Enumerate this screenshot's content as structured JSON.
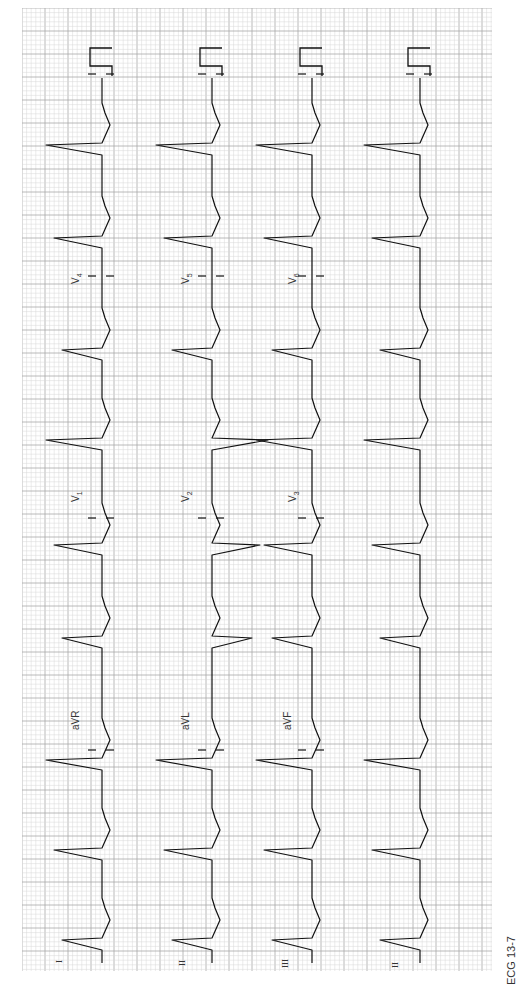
{
  "figure": {
    "caption": "ECG 13-7",
    "orientation": "rotated 90° counter-clockwise (time runs bottom → top)",
    "grid": {
      "paper_color": "#ffffff",
      "minor_line_color": "#d8d8d8",
      "major_line_color": "#a8a8a8",
      "minor_spacing_px": 4.6,
      "major_spacing_px": 23
    },
    "trace_color": "#111111",
    "rows": [
      {
        "name": "row-1",
        "segments": [
          {
            "lead": "I",
            "label": "I"
          },
          {
            "lead": "aVR",
            "label": "aVR"
          },
          {
            "lead": "V1",
            "label": "V",
            "sub": "1"
          },
          {
            "lead": "V4",
            "label": "V",
            "sub": "4"
          }
        ]
      },
      {
        "name": "row-2",
        "segments": [
          {
            "lead": "II",
            "label": "II"
          },
          {
            "lead": "aVL",
            "label": "aVL"
          },
          {
            "lead": "V2",
            "label": "V",
            "sub": "2"
          },
          {
            "lead": "V5",
            "label": "V",
            "sub": "5"
          }
        ]
      },
      {
        "name": "row-3",
        "segments": [
          {
            "lead": "III",
            "label": "III"
          },
          {
            "lead": "aVF",
            "label": "aVF"
          },
          {
            "lead": "V3",
            "label": "V",
            "sub": "3"
          },
          {
            "lead": "V6",
            "label": "V",
            "sub": "6"
          }
        ]
      },
      {
        "name": "rhythm-strip",
        "segments": [
          {
            "lead": "II",
            "label": "II"
          }
        ]
      }
    ]
  }
}
